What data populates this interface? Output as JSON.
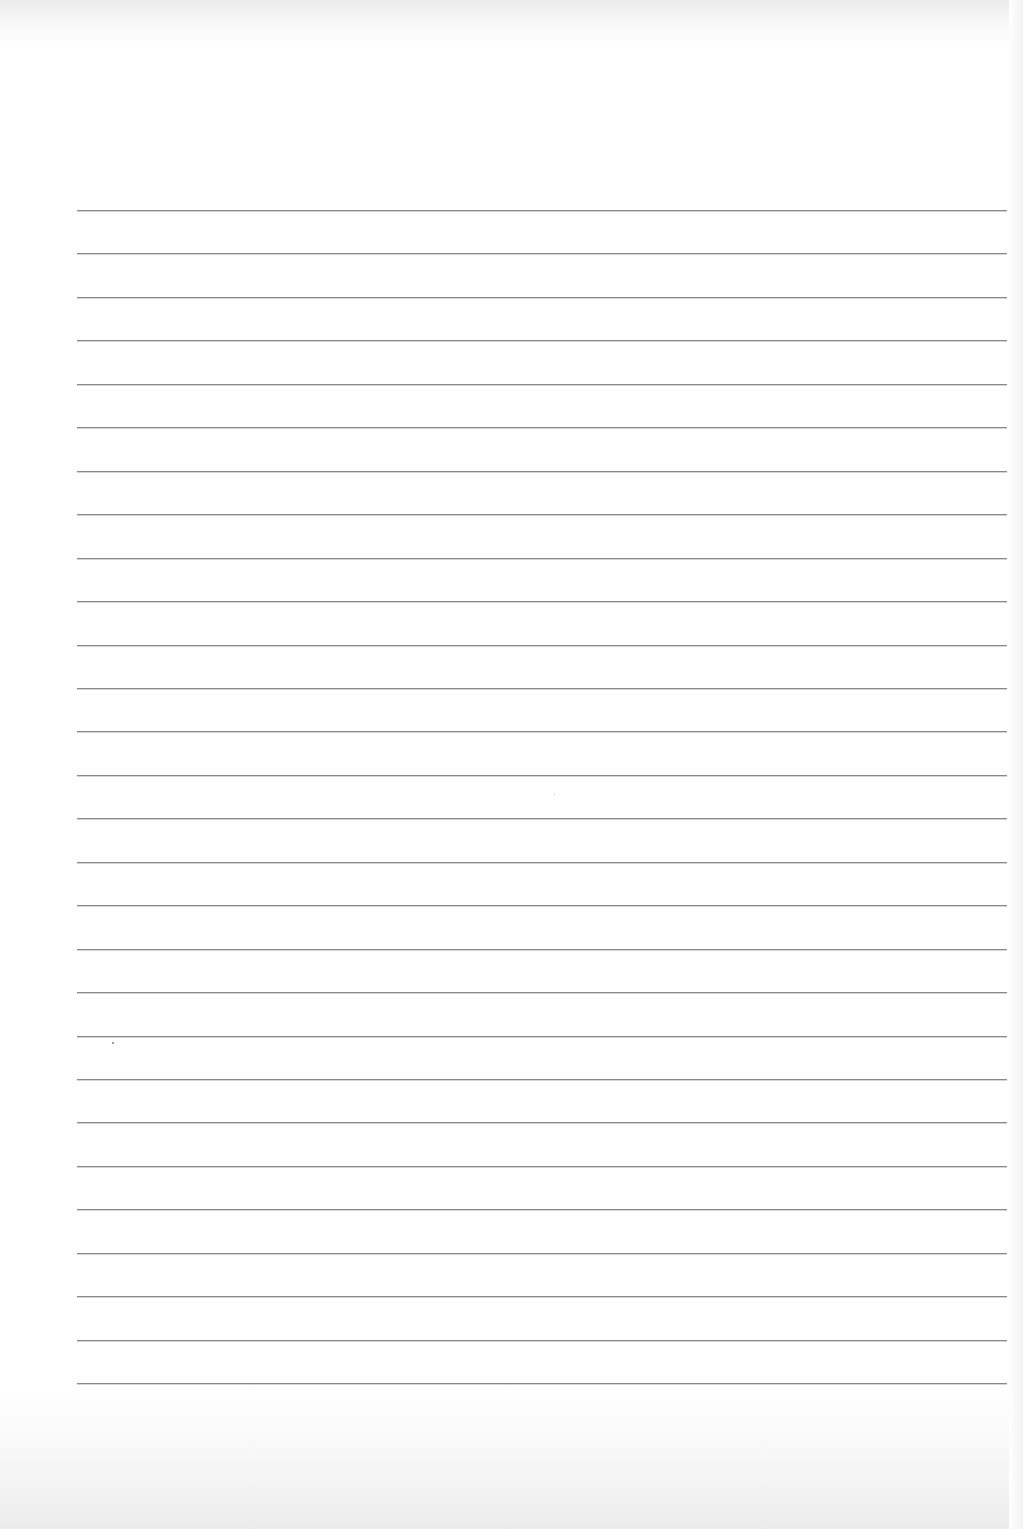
{
  "page": {
    "type": "lined-paper",
    "background_color": "#ffffff",
    "rule_color": "#8a8a8a",
    "rule_count": 28,
    "rule_left": 77,
    "rule_right": 1007,
    "first_rule_y": 210,
    "rule_spacing": 43.45
  },
  "text_content": []
}
